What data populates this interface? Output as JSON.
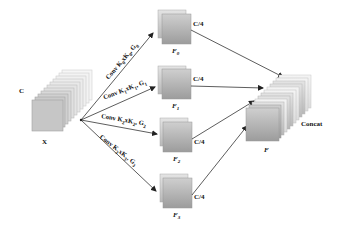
{
  "input": {
    "channel_label": "C",
    "name_label": "X"
  },
  "branches": [
    {
      "conv_label": "Conv K0xK0, G0",
      "conv_prefix": "Conv K",
      "k": "0",
      "mid": "xK",
      "k2": "0",
      "g": ", G",
      "gsub": "0",
      "feature": "F",
      "feature_sub": "0",
      "channels": "C/4"
    },
    {
      "conv_label": "Conv K1xK1, G1",
      "conv_prefix": "Conv K",
      "k": "1",
      "mid": "xK",
      "k2": "1",
      "g": ", G",
      "gsub": "1",
      "feature": "F",
      "feature_sub": "1",
      "channels": "C/4"
    },
    {
      "conv_label": "Conv K2xK2, G2",
      "conv_prefix": "Conv K",
      "k": "2",
      "mid": "xK",
      "k2": "2",
      "g": ", G",
      "gsub": "2",
      "feature": "F",
      "feature_sub": "2",
      "channels": "C/4"
    },
    {
      "conv_label": "Conv K3xK3, G3",
      "conv_prefix": "Conv K",
      "k": "3",
      "mid": "xK",
      "k2": "3",
      "g": ", G",
      "gsub": "3",
      "feature": "F",
      "feature_sub": "3",
      "channels": "C/4"
    }
  ],
  "output": {
    "operation": "Concat",
    "name_label": "F"
  },
  "colors": {
    "stroke": "#333333",
    "box_light": "#f2f2f2",
    "box_dark": "#a8a8a8"
  }
}
